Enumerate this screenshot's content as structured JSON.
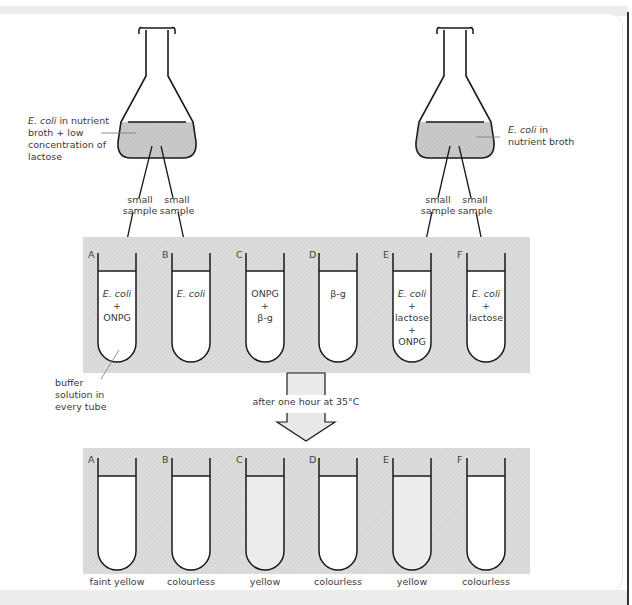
{
  "flasks": [
    {
      "id": "left",
      "label_lines": [
        {
          "italic": "E. coli",
          "text": " in nutrient"
        },
        {
          "italic": "",
          "text": "broth + low"
        },
        {
          "italic": "",
          "text": "concentration of"
        },
        {
          "italic": "",
          "text": "lactose"
        }
      ],
      "samples": [
        "small sample",
        "small sample"
      ],
      "sample_word1": "small",
      "sample_word2": "sample"
    },
    {
      "id": "right",
      "label_lines": [
        {
          "italic": "E. coli",
          "text": " in"
        },
        {
          "italic": "",
          "text": "nutrient broth"
        }
      ],
      "sample_word1": "small",
      "sample_word2": "sample"
    }
  ],
  "setup_tubes": [
    {
      "letter": "A",
      "contents": [
        {
          "t": "E. coli",
          "i": true
        },
        {
          "t": "+",
          "i": false
        },
        {
          "t": "ONPG",
          "i": false
        }
      ]
    },
    {
      "letter": "B",
      "contents": [
        {
          "t": "E. coli",
          "i": true
        }
      ]
    },
    {
      "letter": "C",
      "contents": [
        {
          "t": "ONPG",
          "i": false
        },
        {
          "t": "+",
          "i": false
        },
        {
          "t": "β-g",
          "i": false
        }
      ]
    },
    {
      "letter": "D",
      "contents": [
        {
          "t": "β-g",
          "i": false
        }
      ]
    },
    {
      "letter": "E",
      "contents": [
        {
          "t": "E. coli",
          "i": true
        },
        {
          "t": "+",
          "i": false
        },
        {
          "t": "lactose",
          "i": false
        },
        {
          "t": "+",
          "i": false
        },
        {
          "t": "ONPG",
          "i": false
        }
      ]
    },
    {
      "letter": "F",
      "contents": [
        {
          "t": "E. coli",
          "i": true
        },
        {
          "t": "+",
          "i": false
        },
        {
          "t": "lactose",
          "i": false
        }
      ]
    }
  ],
  "buffer_label": [
    "buffer",
    "solution in",
    "every tube"
  ],
  "process_label": "after one hour at 35°C",
  "result_tubes": [
    {
      "letter": "A",
      "result": "faint yellow",
      "fill": "#ffffff"
    },
    {
      "letter": "B",
      "result": "colourless",
      "fill": "#ffffff"
    },
    {
      "letter": "C",
      "result": "yellow",
      "fill": "#ececec"
    },
    {
      "letter": "D",
      "result": "colourless",
      "fill": "#ffffff"
    },
    {
      "letter": "E",
      "result": "yellow",
      "fill": "#ececec"
    },
    {
      "letter": "F",
      "result": "colourless",
      "fill": "#ffffff"
    }
  ],
  "colors": {
    "hatch_bg": "#d9d9d9",
    "liquid": "#c8c8c8",
    "outline": "#1a1a1a",
    "arrow_fill": "#e8e8e8"
  }
}
